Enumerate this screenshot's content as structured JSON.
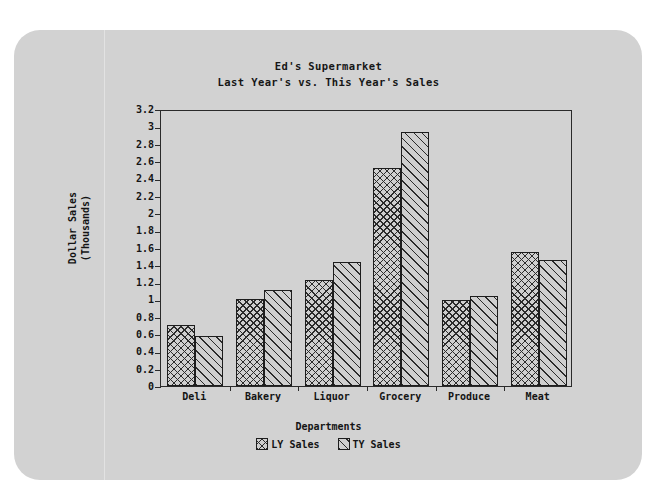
{
  "chart_data": {
    "type": "bar",
    "title": "Ed's Supermarket",
    "subtitle": "Last Year's vs. This Year's Sales",
    "xlabel": "Departments",
    "ylabel": "Dollar Sales\n(Thousands)",
    "ylabel_line1": "Dollar Sales",
    "ylabel_line2": "(Thousands)",
    "categories": [
      "Deli",
      "Bakery",
      "Liquor",
      "Grocery",
      "Produce",
      "Meat"
    ],
    "series": [
      {
        "name": "LY Sales",
        "pattern": "cross-hatch",
        "values": [
          0.7,
          1.01,
          1.22,
          2.52,
          0.99,
          1.55
        ]
      },
      {
        "name": "TY Sales",
        "pattern": "diagonal-hatch",
        "values": [
          0.58,
          1.11,
          1.43,
          2.93,
          1.04,
          1.46
        ]
      }
    ],
    "ylim": [
      0,
      3.2
    ],
    "ytick_step": 0.2,
    "yticks": [
      "0",
      "0.2",
      "0.4",
      "0.6",
      "0.8",
      "1",
      "1.2",
      "1.4",
      "1.6",
      "1.8",
      "2",
      "2.2",
      "2.4",
      "2.6",
      "2.8",
      "3",
      "3.2"
    ],
    "grid": false,
    "legend_position": "bottom",
    "frame": true
  },
  "colors": {
    "paper": "#d2d2d2",
    "page": "#ffffff",
    "ink": "#141414",
    "frame": "#2a2a2a",
    "hatch": "#2b2b2b",
    "bar_fill": "#cfcfcf"
  }
}
